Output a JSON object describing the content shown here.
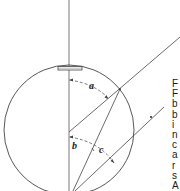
{
  "diagram": {
    "labels": {
      "angle_a": "a",
      "angle_b": "b",
      "angle_c": "c"
    },
    "colors": {
      "stroke": "#444444",
      "dashed": "#555555",
      "background": "#ffffff"
    }
  },
  "side_text": {
    "lines": [
      "F",
      "F",
      "b",
      "b",
      "i",
      "n",
      "c",
      "a",
      "r",
      "s",
      "A"
    ]
  }
}
